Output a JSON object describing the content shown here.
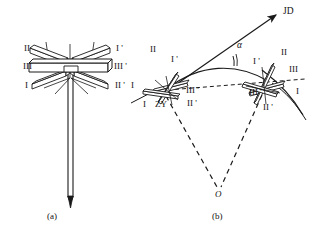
{
  "figure": {
    "type": "technical-line-diagram",
    "captions": {
      "left": "(a)",
      "right": "(b)"
    },
    "panel_a": {
      "labels_left": [
        "II",
        "III",
        "I"
      ],
      "labels_right": [
        "I '",
        "III '",
        "II '"
      ],
      "mast": "vertical-mast-with-pointed-tip"
    },
    "panel_b": {
      "direction_label": "JD",
      "angle_label": "α",
      "vertex_label": "O",
      "station_label": "ZY",
      "antenna_left": {
        "labels_upper_left": [
          "II"
        ],
        "labels_upper_right": [
          "I '"
        ],
        "labels_left": [
          "I"
        ],
        "labels_lower": [
          "III '",
          "II '"
        ],
        "labels_bottom_left": [
          "I"
        ]
      },
      "antenna_right": {
        "labels_upper_right": [
          "II",
          "III"
        ],
        "labels_upper_left": [
          "I '"
        ],
        "labels_lower_left": [
          "III '"
        ],
        "labels_lower": [
          "II '"
        ],
        "labels_right": [
          "I"
        ]
      }
    },
    "colors": {
      "stroke": "#1a1a1a",
      "fill": "#ffffff",
      "background": "#ffffff"
    }
  }
}
